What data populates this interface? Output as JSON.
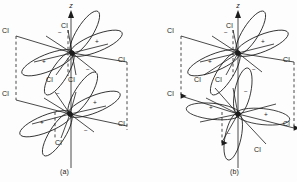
{
  "figure": {
    "type": "molecular-orbital-diagram",
    "stroke_color": "#1c1c1c",
    "background_color": "#fdfdfd"
  },
  "panels": [
    {
      "id": "a",
      "caption": "(a)",
      "axis_label": "z",
      "centers": [
        {
          "cx": 72,
          "cy": 53
        },
        {
          "cx": 70,
          "cy": 114
        }
      ],
      "lobe_signs_upper": [
        "-",
        "+",
        "+",
        "-"
      ],
      "lobe_signs_lower": [
        "-",
        "+",
        "+",
        "-"
      ],
      "ligand_labels": [
        {
          "text": "Cl",
          "x": 3,
          "y": 33
        },
        {
          "text": "Cl",
          "x": 119,
          "y": 62
        },
        {
          "text": "Cl",
          "x": 62,
          "y": 30
        },
        {
          "text": "Cl",
          "x": 49,
          "y": 78
        },
        {
          "text": "Cl",
          "x": 72,
          "y": 78
        },
        {
          "text": "Cl",
          "x": 3,
          "y": 96
        },
        {
          "text": "Cl",
          "x": 119,
          "y": 126
        },
        {
          "text": "Cl",
          "x": 58,
          "y": 143
        }
      ],
      "dashed_guides": 3,
      "arrows": []
    },
    {
      "id": "b",
      "caption": "(b)",
      "axis_label": "z",
      "centers": [
        {
          "cx": 238,
          "cy": 53
        },
        {
          "cx": 238,
          "cy": 114
        }
      ],
      "lobe_signs_upper": [
        "-",
        "+",
        "+",
        "-"
      ],
      "lobe_signs_lower": [
        "-",
        "+",
        "+",
        "-"
      ],
      "ligand_labels": [
        {
          "text": "Cl",
          "x": 168,
          "y": 33
        },
        {
          "text": "Cl",
          "x": 283,
          "y": 62
        },
        {
          "text": "Cl",
          "x": 228,
          "y": 30
        },
        {
          "text": "Cl",
          "x": 196,
          "y": 78
        },
        {
          "text": "Cl",
          "x": 218,
          "y": 78
        },
        {
          "text": "Cl",
          "x": 168,
          "y": 96
        },
        {
          "text": "Cl",
          "x": 283,
          "y": 126
        },
        {
          "text": "Cl",
          "x": 256,
          "y": 150
        }
      ],
      "dashed_guides": 3,
      "arrows": [
        "down-left",
        "down-center",
        "down-right"
      ]
    }
  ],
  "signs": {
    "plus": "+",
    "minus": "−"
  },
  "labels": {
    "z_axis": "z",
    "chlorine": "Cl",
    "caption_a": "(a)",
    "caption_b": "(b)"
  }
}
